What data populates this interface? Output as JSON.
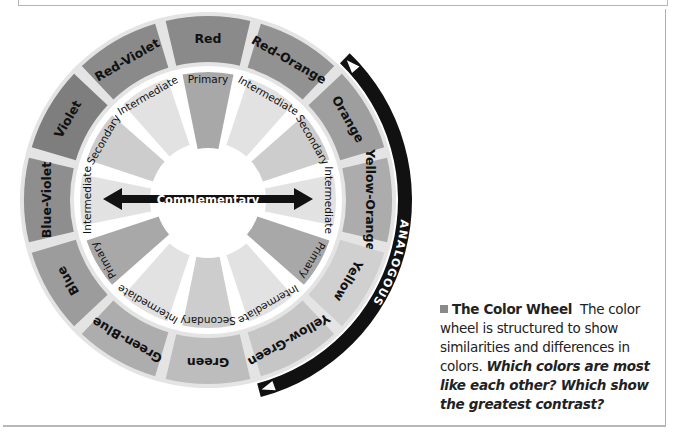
{
  "wheel": {
    "center": [
      208,
      200
    ],
    "colors": {
      "disk_background": "#e4e4e4",
      "ring_gap": "#ffffff",
      "analogous_band": "#111111",
      "complementary_arrow": "#111111"
    },
    "segments": [
      {
        "name": "Red",
        "angle": 0,
        "outer_color": "#8a8a8a",
        "inner_label": "Primary",
        "inner_color": "#a8a8a8"
      },
      {
        "name": "Red-Orange",
        "angle": 30,
        "outer_color": "#929292",
        "inner_label": "Intermediate",
        "inner_color": "#e2e2e2"
      },
      {
        "name": "Orange",
        "angle": 60,
        "outer_color": "#9e9e9e",
        "inner_label": "Secondary",
        "inner_color": "#cdcdcd"
      },
      {
        "name": "Yellow-Orange",
        "angle": 90,
        "outer_color": "#acacac",
        "inner_label": "Intermediate",
        "inner_color": "#e2e2e2"
      },
      {
        "name": "Yellow",
        "angle": 120,
        "outer_color": "#d0d0d0",
        "inner_label": "Primary",
        "inner_color": "#a8a8a8"
      },
      {
        "name": "Yellow-Green",
        "angle": 150,
        "outer_color": "#c6c6c6",
        "inner_label": "Intermediate",
        "inner_color": "#e2e2e2"
      },
      {
        "name": "Green",
        "angle": 180,
        "outer_color": "#bdbdbd",
        "inner_label": "Secondary",
        "inner_color": "#cdcdcd"
      },
      {
        "name": "Green-Blue",
        "angle": 210,
        "outer_color": "#adadad",
        "inner_label": "Intermediate",
        "inner_color": "#e2e2e2"
      },
      {
        "name": "Blue",
        "angle": 240,
        "outer_color": "#9c9c9c",
        "inner_label": "Primary",
        "inner_color": "#a8a8a8"
      },
      {
        "name": "Blue-Violet",
        "angle": 270,
        "outer_color": "#8e8e8e",
        "inner_label": "Intermediate",
        "inner_color": "#e2e2e2"
      },
      {
        "name": "Violet",
        "angle": 300,
        "outer_color": "#7e7e7e",
        "inner_label": "Secondary",
        "inner_color": "#cdcdcd"
      },
      {
        "name": "Red-Violet",
        "angle": 330,
        "outer_color": "#8a8a8a",
        "inner_label": "Intermediate",
        "inner_color": "#e2e2e2"
      }
    ],
    "complementary_label": "Complementary",
    "analogous_label": "ANALOGOUS"
  },
  "caption": {
    "title": "The Color Wheel",
    "body": "The color wheel is structured to show similarities and differences in colors.",
    "question": "Which colors are most like each other? Which show the greatest contrast?"
  }
}
